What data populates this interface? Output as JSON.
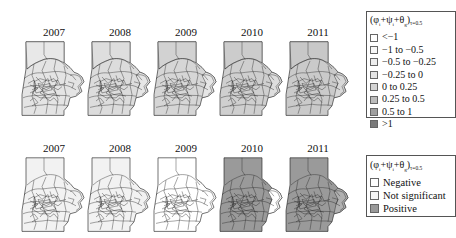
{
  "figure": {
    "rows": [
      {
        "id": "point-estimates",
        "panels": [
          {
            "year": "2007",
            "fill": "#e4e4e4",
            "outlier_fill": "#e4e4e4"
          },
          {
            "year": "2008",
            "fill": "#dcdcdc",
            "outlier_fill": "#e4e4e4"
          },
          {
            "year": "2009",
            "fill": "#d6d6d6",
            "outlier_fill": "#e6e6e6"
          },
          {
            "year": "2010",
            "fill": "#cfcfcf",
            "outlier_fill": "#dedede"
          },
          {
            "year": "2011",
            "fill": "#cacaca",
            "outlier_fill": "#d8d8d8"
          }
        ]
      },
      {
        "id": "significance",
        "panels": [
          {
            "year": "2007",
            "fill": "#f2f2f2",
            "outlier_fill": "#f2f2f2"
          },
          {
            "year": "2008",
            "fill": "#f2f2f2",
            "outlier_fill": "#f2f2f2"
          },
          {
            "year": "2009",
            "fill": "#ffffff",
            "outlier_fill": "#ffffff"
          },
          {
            "year": "2010",
            "fill": "#9a9a9a",
            "outlier_fill": "#ffffff"
          },
          {
            "year": "2011",
            "fill": "#9a9a9a",
            "outlier_fill": "#b8b8b8"
          }
        ]
      }
    ],
    "legend_values": {
      "title_main": "(φ",
      "title_i1": "i",
      "title_plus1": "+ψ",
      "title_i2": "i",
      "title_plus2": "+θ",
      "title_sub_theta": "g",
      "title_close": ")",
      "title_subscript": "τ=0.5",
      "items": [
        {
          "label": "<−1",
          "color": "#ffffff"
        },
        {
          "label": "−1 to −0.5",
          "color": "#f7f7f7"
        },
        {
          "label": "−0.5 to −0.25",
          "color": "#eeeeee"
        },
        {
          "label": "−0.25 to 0",
          "color": "#e4e4e4"
        },
        {
          "label": "0 to 0.25",
          "color": "#d4d4d4"
        },
        {
          "label": "0.25 to 0.5",
          "color": "#bdbdbd"
        },
        {
          "label": "0.5 to 1",
          "color": "#9f9f9f"
        },
        {
          "label": ">1",
          "color": "#7a7a7a"
        }
      ]
    },
    "legend_significance": {
      "title_main": "(φ",
      "title_i1": "i",
      "title_plus1": "+ψ",
      "title_i2": "i",
      "title_plus2": "+θ",
      "title_sub_theta": "g",
      "title_close": ")",
      "title_subscript": "τ=0.5",
      "items": [
        {
          "label": "Negative",
          "color": "#ffffff"
        },
        {
          "label": "Not significant",
          "color": "#f5f5f5"
        },
        {
          "label": "Positive",
          "color": "#9a9a9a"
        }
      ]
    }
  }
}
